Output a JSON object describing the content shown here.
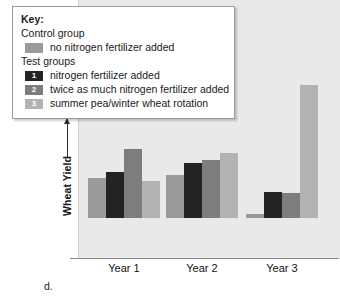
{
  "caption": "d.",
  "legend": {
    "title": "Key:",
    "control_heading": "Control group",
    "test_heading": "Test groups",
    "entries": [
      {
        "marker": "",
        "label": "no nitrogen fertilizer added",
        "color": "#9a9a9a",
        "group": "control"
      },
      {
        "marker": "1",
        "label": "nitrogen fertilizer added",
        "color": "#232323",
        "group": "test"
      },
      {
        "marker": "2",
        "label": "twice as much nitrogen fertilizer added",
        "color": "#7d7d7d",
        "group": "test"
      },
      {
        "marker": "3",
        "label": "summer pea/winter wheat rotation",
        "color": "#b3b3b3",
        "group": "test"
      }
    ]
  },
  "chart_data": {
    "type": "bar",
    "title": "",
    "xlabel": "",
    "ylabel": "Wheat Yield",
    "grid": false,
    "legend_position": "top-left",
    "y_axis_arrow": true,
    "y_tick_labels": [],
    "categories": [
      "Year 1",
      "Year 2",
      "Year 3"
    ],
    "series": [
      {
        "name": "no nitrogen fertilizer added",
        "marker": "",
        "color": "#9a9a9a",
        "values": [
          43,
          46,
          4
        ]
      },
      {
        "name": "nitrogen fertilizer added",
        "marker": "1",
        "color": "#232323",
        "values": [
          49,
          59,
          28
        ]
      },
      {
        "name": "twice as much nitrogen fertilizer added",
        "marker": "2",
        "color": "#7d7d7d",
        "values": [
          74,
          62,
          27
        ]
      },
      {
        "name": "summer pea/winter wheat rotation",
        "marker": "3",
        "color": "#b3b3b3",
        "values": [
          40,
          70,
          143
        ]
      }
    ]
  },
  "style": {
    "plot_background": "#e9e9e9",
    "page_background": "#ffffff",
    "axis_color": "#8a8a8a",
    "text_color": "#161616"
  }
}
